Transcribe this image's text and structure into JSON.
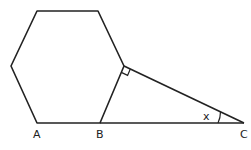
{
  "diagram": {
    "type": "geometry",
    "shapes": [
      "regular-hexagon",
      "right-triangle"
    ],
    "labels": {
      "A": "A",
      "B": "B",
      "C": "C",
      "angle": "x"
    },
    "stroke_color": "#222222",
    "background": "#ffffff"
  }
}
